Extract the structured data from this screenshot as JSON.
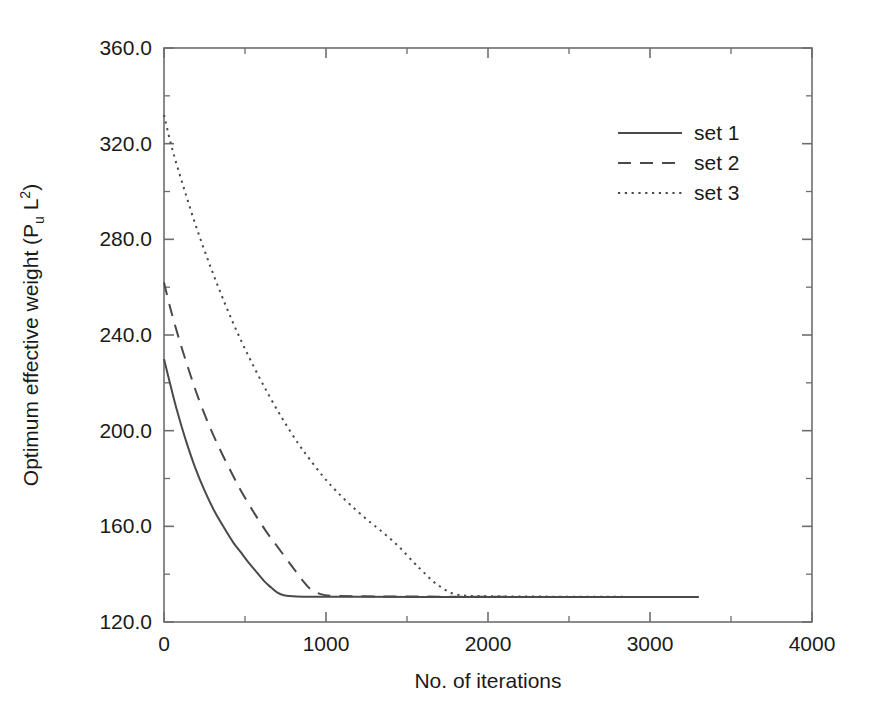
{
  "figure": {
    "background_color": "#ffffff",
    "line_color": "#4a4a4a",
    "axis_color": "#6e6e6e"
  },
  "axes": {
    "x_title": "No. of iterations",
    "y_title_main": "Optimum effective weight (P",
    "y_title_sub": "u",
    "y_title_mid": " L",
    "y_title_sup": "2",
    "y_title_end": ")",
    "x_tick_labels": [
      "0",
      "1000",
      "2000",
      "3000",
      "4000"
    ],
    "y_tick_labels": [
      "120.0",
      "160.0",
      "200.0",
      "240.0",
      "280.0",
      "320.0",
      "360.0"
    ]
  },
  "legend": {
    "entries": [
      {
        "label": "set 1",
        "style": "solid"
      },
      {
        "label": "set 2",
        "style": "dashed"
      },
      {
        "label": "set 3",
        "style": "dotted"
      }
    ]
  },
  "chart_data": {
    "type": "line",
    "title": "",
    "xlabel": "No. of iterations",
    "ylabel": "Optimum effective weight (P_u L^2)",
    "xlim": [
      0,
      4000
    ],
    "ylim": [
      120,
      360
    ],
    "x_ticks": [
      0,
      1000,
      2000,
      3000,
      4000
    ],
    "y_ticks": [
      120,
      160,
      200,
      240,
      280,
      320,
      360
    ],
    "x_minor_tick_step": 500,
    "y_minor_tick_step": 20,
    "grid": false,
    "legend_position": "upper right",
    "plateau_value": 130.5,
    "series": [
      {
        "name": "set 1",
        "style": "solid",
        "x": [
          0,
          40,
          80,
          130,
          190,
          250,
          310,
          370,
          430,
          470,
          520,
          570,
          620,
          660,
          700,
          740,
          820,
          950,
          1200,
          1600,
          2100,
          2700,
          3300
        ],
        "y": [
          230.0,
          219.0,
          208.5,
          197.0,
          185.0,
          175.0,
          166.5,
          159.5,
          153.0,
          149.5,
          145.0,
          141.0,
          137.0,
          134.5,
          132.3,
          131.2,
          130.7,
          130.6,
          130.6,
          130.5,
          130.5,
          130.5,
          130.5
        ]
      },
      {
        "name": "set 2",
        "style": "dashed",
        "x": [
          0,
          40,
          90,
          150,
          210,
          280,
          350,
          420,
          470,
          530,
          590,
          650,
          700,
          760,
          810,
          860,
          900,
          960,
          1050,
          1300,
          1700,
          2200,
          2800,
          3300
        ],
        "y": [
          262.0,
          251.0,
          239.0,
          226.0,
          214.0,
          202.0,
          191.5,
          182.0,
          175.5,
          168.5,
          162.0,
          156.0,
          151.5,
          146.0,
          141.5,
          137.0,
          134.0,
          131.8,
          130.9,
          130.7,
          130.6,
          130.5,
          130.5,
          130.5
        ]
      },
      {
        "name": "set 3",
        "style": "dotted",
        "x": [
          0,
          50,
          120,
          200,
          290,
          380,
          470,
          560,
          650,
          740,
          830,
          900,
          980,
          1060,
          1150,
          1250,
          1350,
          1450,
          1540,
          1600,
          1680,
          1800,
          2000,
          2400,
          2900,
          3300
        ],
        "y": [
          332.0,
          318.0,
          302.0,
          285.0,
          268.0,
          252.5,
          238.5,
          226.0,
          214.5,
          204.0,
          194.5,
          188.0,
          181.0,
          175.0,
          169.0,
          163.0,
          157.5,
          151.5,
          145.0,
          141.0,
          136.0,
          131.6,
          130.8,
          130.6,
          130.5,
          130.5
        ]
      }
    ]
  }
}
